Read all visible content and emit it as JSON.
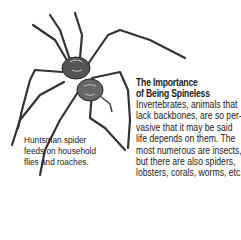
{
  "article": {
    "title_lines": [
      "The Importance",
      "of Being Spineless"
    ],
    "body_lines": [
      "Invertebrates, animals that",
      "lack backbones, are so per-",
      "vasive that it may be said",
      "life depends on them. The",
      "most numerous are insects,",
      "but there are also spiders,",
      "lobsters, corals, worms, etc."
    ]
  },
  "caption": {
    "lines": [
      "Huntsman spider",
      "feeds on household",
      "flies and roaches."
    ]
  },
  "illustration": {
    "subject": "huntsman-spider-drawing"
  }
}
